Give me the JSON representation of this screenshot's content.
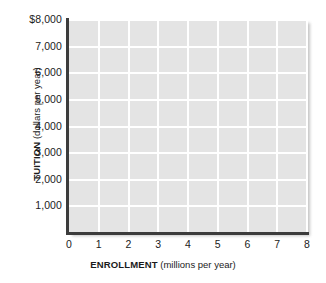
{
  "chart_data": {
    "type": "line",
    "title": "",
    "subtitle": "",
    "xlabel_bold": "ENROLLMENT",
    "xlabel_unit": "(millions per year)",
    "ylabel_bold": "TUITION",
    "ylabel_unit": "(dollars per year)",
    "xlim": [
      0,
      8
    ],
    "ylim": [
      0,
      8000
    ],
    "x_ticks": [
      "0",
      "1",
      "2",
      "3",
      "4",
      "5",
      "6",
      "7",
      "8"
    ],
    "x_tick_values": [
      0,
      1,
      2,
      3,
      4,
      5,
      6,
      7,
      8
    ],
    "y_ticks": [
      "1,000",
      "2,000",
      "3,000",
      "4,000",
      "5,000",
      "6,000",
      "7,000",
      "$8,000"
    ],
    "y_tick_values": [
      1000,
      2000,
      3000,
      4000,
      5000,
      6000,
      7000,
      8000
    ],
    "grid": true,
    "grid_color": "#ffffff",
    "plot_background": "#e4e4e4",
    "axis_color": "#3c3c3c",
    "legend": null,
    "legend_position": "none",
    "series": [],
    "values": [],
    "annotations": [],
    "note": "Empty coordinate grid; no data series are plotted."
  },
  "axes": {
    "y_title": {
      "bold": "TUITION",
      "unit": "(dollars per year)"
    },
    "x_title": {
      "bold": "ENROLLMENT",
      "unit": "(millions per year)"
    }
  }
}
